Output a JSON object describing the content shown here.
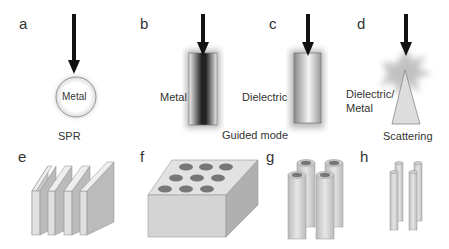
{
  "panels": {
    "a": {
      "letter": "a",
      "inner_label": "Metal",
      "caption": "SPR"
    },
    "b": {
      "letter": "b",
      "side_label": "Metal"
    },
    "c": {
      "letter": "c",
      "side_label": "Dielectric"
    },
    "bc_caption": "Guided mode",
    "d": {
      "letter": "d",
      "side_label_line1": "Dielectric/",
      "side_label_line2": "Metal",
      "caption": "Scattering"
    },
    "e": {
      "letter": "e"
    },
    "f": {
      "letter": "f"
    },
    "g": {
      "letter": "g"
    },
    "h": {
      "letter": "h"
    }
  },
  "icons": {
    "arrow": "down-arrow",
    "sphere": "metal-sphere",
    "rod_metal": "metal-rod",
    "rod_dielectric": "dielectric-rod",
    "cone": "cone-scatterer",
    "slabs": "layered-slabs",
    "block": "perforated-block",
    "tubes": "tube-array",
    "rods": "thin-rod-array"
  },
  "colors": {
    "arrow": "#111111",
    "gray": "#cfcfcf",
    "edge": "#888888"
  }
}
